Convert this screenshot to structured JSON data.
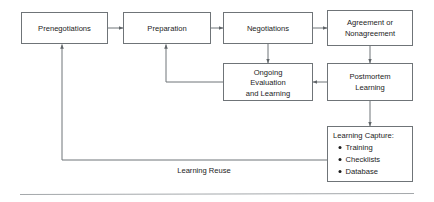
{
  "diagram": {
    "colors": {
      "box_stroke": "#6f7478",
      "box_fill": "#ffffff",
      "text": "#1c1c1c",
      "edge": "#6f7478",
      "rule": "#9a9ea1",
      "background": "#ffffff"
    },
    "nodes": [
      {
        "id": "prenegotiations",
        "label": "Prenegotiations",
        "lines": [
          "Prenegotiations"
        ]
      },
      {
        "id": "preparation",
        "label": "Preparation",
        "lines": [
          "Preparation"
        ]
      },
      {
        "id": "negotiations",
        "label": "Negotiations",
        "lines": [
          "Negotiations"
        ]
      },
      {
        "id": "agreement-or-nonagreement",
        "label": "Agreement or Nonagreement",
        "lines": [
          "Agreement or",
          "Nonagreement"
        ]
      },
      {
        "id": "ongoing-evaluation-and-learning",
        "label": "Ongoing Evaluation and Learning",
        "lines": [
          "Ongoing",
          "Evaluation",
          "and Learning"
        ]
      },
      {
        "id": "postmortem-learning",
        "label": "Postmortem Learning",
        "lines": [
          "Postmortem",
          "Learning"
        ]
      },
      {
        "id": "learning-capture",
        "label": "Learning Capture:",
        "heading": "Learning Capture:",
        "bullets": [
          "Training",
          "Checklists",
          "Database"
        ]
      }
    ],
    "edge_labels": [
      {
        "id": "learning-reuse",
        "label": "Learning Reuse"
      }
    ]
  }
}
